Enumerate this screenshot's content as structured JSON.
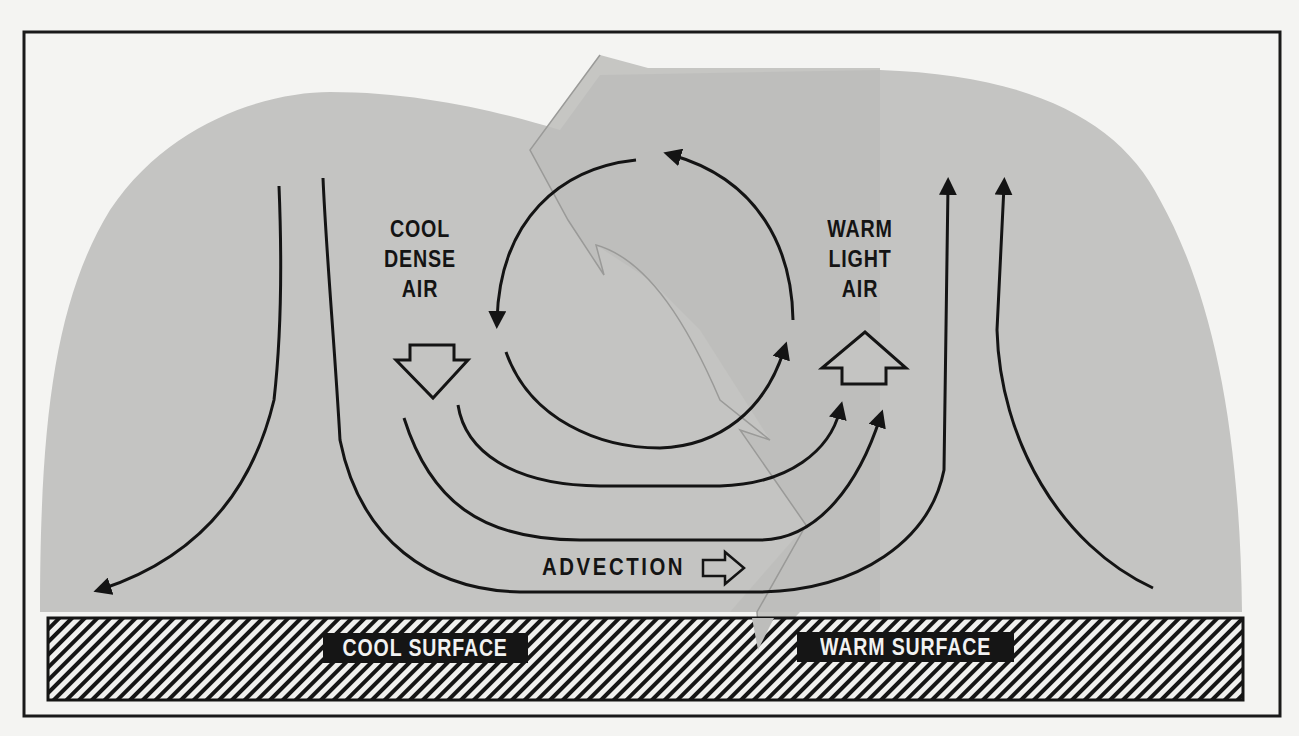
{
  "diagram": {
    "type": "atmospheric-circulation-diagram",
    "colors": {
      "paper": "#f4f4f2",
      "air_mass_fill": "#c4c4c2",
      "front_arrow_fill": "#bdbdbb",
      "line": "#141414",
      "label_box": "#151515",
      "label_text": "#f2f2f2"
    },
    "labels": {
      "cool_air": [
        "COOL",
        "DENSE",
        "AIR"
      ],
      "warm_air": [
        "WARM",
        "LIGHT",
        "AIR"
      ],
      "advection": "ADVECTION",
      "cool_surface": "COOL SURFACE",
      "warm_surface": "WARM SURFACE"
    },
    "elements": {
      "frame": "outer-border",
      "air_mass": "grey-rounded-air-mass",
      "front_band": "large-grey-front-arrow",
      "convection_cycle": "circular-arrows-clockwise-3-segments",
      "sinking_air": "down-outline-arrow",
      "rising_air": "up-outline-arrow",
      "advection_direction": "right-outline-arrow",
      "ground": "hatched-surface-strip"
    }
  }
}
